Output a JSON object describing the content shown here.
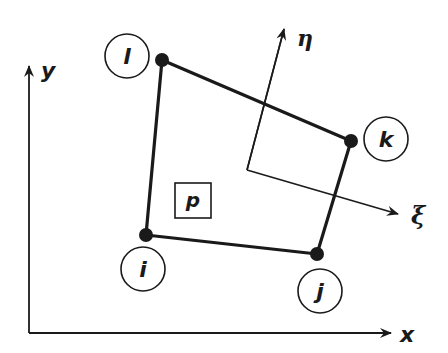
{
  "diagram": {
    "type": "finite-element-quadrilateral",
    "colors": {
      "ink": "#1a1a1a",
      "background": "#ffffff"
    },
    "global_axes": {
      "x_label": "x",
      "y_label": "y",
      "origin": [
        29,
        333
      ],
      "x_tip": [
        392,
        333
      ],
      "y_tip": [
        29,
        65
      ]
    },
    "local_axes": {
      "xi_label": "ξ",
      "eta_label": "η",
      "origin": [
        247,
        170
      ],
      "xi_tip": [
        399,
        214
      ],
      "eta_tip": [
        284,
        28
      ]
    },
    "element": {
      "label": "p",
      "label_box": {
        "x": 175,
        "y": 183,
        "w": 36,
        "h": 35
      }
    },
    "nodes": [
      {
        "id": "i",
        "label": "i",
        "pos": [
          146,
          235
        ],
        "circle": [
          143,
          269
        ]
      },
      {
        "id": "j",
        "label": "j",
        "pos": [
          317,
          254
        ],
        "circle": [
          320,
          291
        ]
      },
      {
        "id": "k",
        "label": "k",
        "pos": [
          351,
          141
        ],
        "circle": [
          386,
          139
        ]
      },
      {
        "id": "l",
        "label": "l",
        "pos": [
          162,
          60
        ],
        "circle": [
          127,
          56
        ]
      }
    ],
    "edges": [
      [
        "i",
        "j"
      ],
      [
        "j",
        "k"
      ],
      [
        "k",
        "l"
      ],
      [
        "l",
        "i"
      ]
    ]
  }
}
